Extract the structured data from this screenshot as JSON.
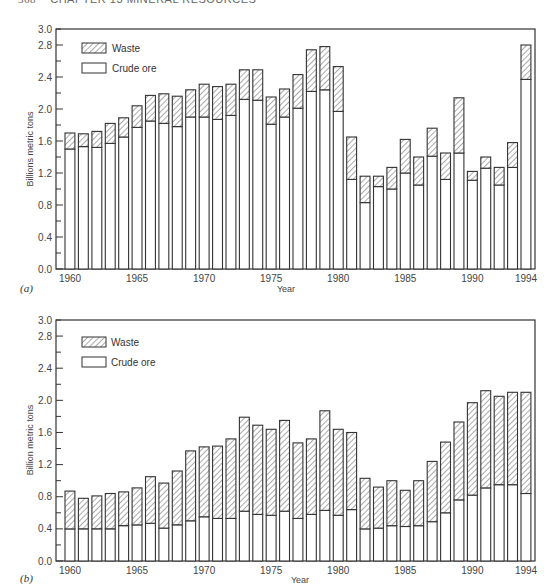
{
  "page_header": {
    "page_number": "368",
    "chapter": "CHAPTER 13  MINERAL RESOURCES"
  },
  "chart_data": [
    {
      "id": "a",
      "type": "bar",
      "stacked": true,
      "panel_label": "(a)",
      "title": "",
      "xlabel": "Year",
      "ylabel": "Billions metric tons",
      "ylim": [
        0,
        3.0
      ],
      "yticks": [
        "0.0",
        "0.4",
        "0.8",
        "1.2",
        "1.6",
        "2.0",
        "2.4",
        "2.8",
        "3.0"
      ],
      "xticks": [
        "1960",
        "1965",
        "1970",
        "1975",
        "1980",
        "1985",
        "1990",
        "1994"
      ],
      "legend": [
        {
          "name": "Waste",
          "pattern": "hatched"
        },
        {
          "name": "Crude ore",
          "pattern": "plain"
        }
      ],
      "legend_position": "upper-left",
      "categories": [
        1960,
        1961,
        1962,
        1963,
        1964,
        1965,
        1966,
        1967,
        1968,
        1969,
        1970,
        1971,
        1972,
        1973,
        1974,
        1975,
        1976,
        1977,
        1978,
        1979,
        1980,
        1981,
        1982,
        1983,
        1984,
        1985,
        1986,
        1987,
        1988,
        1989,
        1990,
        1991,
        1992,
        1993,
        1994
      ],
      "series": [
        {
          "name": "Crude ore",
          "values": [
            1.5,
            1.53,
            1.52,
            1.57,
            1.65,
            1.77,
            1.85,
            1.82,
            1.78,
            1.9,
            1.9,
            1.87,
            1.92,
            2.12,
            2.11,
            1.81,
            1.9,
            2.01,
            2.22,
            2.24,
            1.97,
            1.12,
            0.83,
            1.03,
            1.0,
            1.2,
            1.05,
            1.41,
            1.12,
            1.45,
            1.11,
            1.26,
            1.05,
            1.27,
            2.37
          ]
        },
        {
          "name": "Waste",
          "values": [
            0.2,
            0.16,
            0.2,
            0.25,
            0.24,
            0.27,
            0.32,
            0.37,
            0.38,
            0.34,
            0.41,
            0.41,
            0.39,
            0.37,
            0.38,
            0.34,
            0.35,
            0.42,
            0.52,
            0.54,
            0.56,
            0.53,
            0.33,
            0.13,
            0.27,
            0.42,
            0.35,
            0.35,
            0.33,
            0.69,
            0.11,
            0.14,
            0.22,
            0.31,
            0.43
          ]
        }
      ],
      "totals": [
        1.7,
        1.69,
        1.72,
        1.82,
        1.89,
        2.04,
        2.17,
        2.19,
        2.16,
        2.24,
        2.31,
        2.28,
        2.31,
        2.49,
        2.49,
        2.15,
        2.25,
        2.43,
        2.74,
        2.78,
        2.53,
        1.65,
        1.16,
        1.16,
        1.27,
        1.62,
        1.4,
        1.76,
        1.45,
        2.14,
        1.22,
        1.4,
        1.27,
        1.58,
        2.8
      ]
    },
    {
      "id": "b",
      "type": "bar",
      "stacked": true,
      "panel_label": "(b)",
      "title": "",
      "xlabel": "Year",
      "ylabel": "Billion metric tons",
      "ylim": [
        0,
        3.0
      ],
      "yticks": [
        "0.0",
        "0.4",
        "0.8",
        "1.2",
        "1.6",
        "2.0",
        "2.4",
        "2.8",
        "3.0"
      ],
      "xticks": [
        "1960",
        "1965",
        "1970",
        "1975",
        "1980",
        "1985",
        "1990",
        "1994"
      ],
      "legend": [
        {
          "name": "Waste",
          "pattern": "hatched"
        },
        {
          "name": "Crude ore",
          "pattern": "plain"
        }
      ],
      "legend_position": "upper-left",
      "categories": [
        1960,
        1961,
        1962,
        1963,
        1964,
        1965,
        1966,
        1967,
        1968,
        1969,
        1970,
        1971,
        1972,
        1973,
        1974,
        1975,
        1976,
        1977,
        1978,
        1979,
        1980,
        1981,
        1982,
        1983,
        1984,
        1985,
        1986,
        1987,
        1988,
        1989,
        1990,
        1991,
        1992,
        1993,
        1994
      ],
      "series": [
        {
          "name": "Crude ore",
          "values": [
            0.4,
            0.4,
            0.4,
            0.4,
            0.44,
            0.45,
            0.47,
            0.41,
            0.45,
            0.5,
            0.55,
            0.53,
            0.53,
            0.62,
            0.58,
            0.57,
            0.62,
            0.53,
            0.58,
            0.63,
            0.57,
            0.64,
            0.4,
            0.41,
            0.44,
            0.43,
            0.44,
            0.49,
            0.6,
            0.76,
            0.82,
            0.91,
            0.95,
            0.95,
            0.84
          ]
        },
        {
          "name": "Waste",
          "values": [
            0.47,
            0.38,
            0.41,
            0.44,
            0.42,
            0.46,
            0.58,
            0.56,
            0.67,
            0.87,
            0.87,
            0.9,
            0.99,
            1.17,
            1.11,
            1.07,
            1.13,
            0.94,
            0.94,
            1.24,
            1.07,
            0.96,
            0.63,
            0.51,
            0.56,
            0.45,
            0.56,
            0.75,
            0.88,
            0.97,
            1.15,
            1.21,
            1.1,
            1.15,
            1.26
          ]
        }
      ],
      "totals": [
        0.87,
        0.78,
        0.81,
        0.84,
        0.86,
        0.91,
        1.05,
        0.97,
        1.12,
        1.37,
        1.42,
        1.43,
        1.52,
        1.79,
        1.69,
        1.64,
        1.75,
        1.47,
        1.52,
        1.87,
        1.64,
        1.6,
        1.03,
        0.92,
        1.0,
        0.88,
        1.0,
        1.24,
        1.48,
        1.73,
        1.97,
        2.12,
        2.05,
        2.1,
        2.1
      ]
    }
  ],
  "style": {
    "bar_stroke": "#333333",
    "bar_fill": "#ffffff",
    "hatch_color": "#555555",
    "axis_color": "#333333"
  }
}
